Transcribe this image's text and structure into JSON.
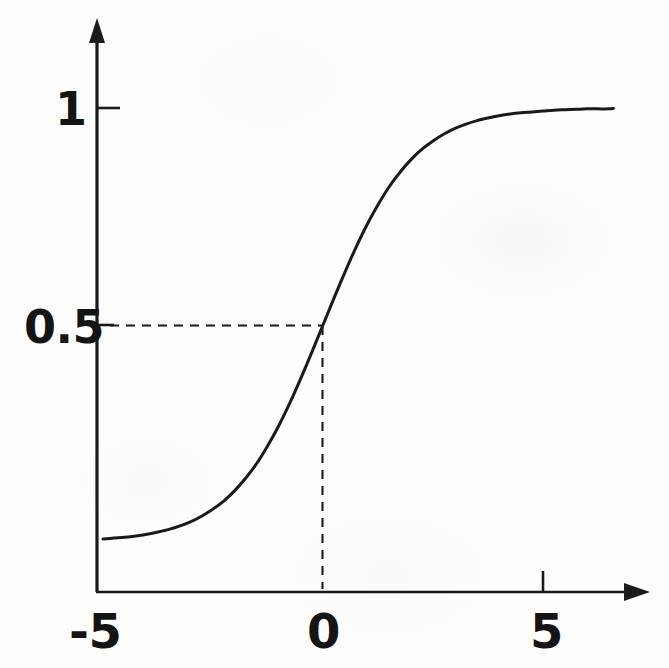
{
  "figure": {
    "kind": "line-plot",
    "background_color": "#fdfdfb",
    "ink_color": "#1a1a1a"
  },
  "labels": {
    "y_tick_one": "1",
    "y_tick_half": "0.5",
    "x_tick_minus_five": "-5",
    "x_tick_zero": "0",
    "x_tick_five": "5"
  },
  "chart_data": {
    "type": "line",
    "title": "",
    "xlabel": "",
    "ylabel": "",
    "xlim": [
      -5,
      6.6
    ],
    "ylim": [
      0,
      1.08
    ],
    "grid": false,
    "legend": null,
    "axis_style": "arrow-tipped open axes",
    "xticks": [
      -5,
      0,
      5
    ],
    "xtick_labels": [
      "-5",
      "0",
      "5"
    ],
    "yticks": [
      0.5,
      1
    ],
    "ytick_labels": [
      "0.5",
      "1"
    ],
    "series": [
      {
        "name": "sigmoid",
        "x": [
          -5.0,
          -4.75,
          -4.5,
          -4.25,
          -4.0,
          -3.75,
          -3.5,
          -3.25,
          -3.0,
          -2.75,
          -2.5,
          -2.25,
          -2.0,
          -1.75,
          -1.5,
          -1.25,
          -1.0,
          -0.75,
          -0.5,
          -0.25,
          0.0,
          0.25,
          0.5,
          0.75,
          1.0,
          1.25,
          1.5,
          1.75,
          2.0,
          2.25,
          2.5,
          2.75,
          3.0,
          3.25,
          3.5,
          3.75,
          4.0,
          4.25,
          4.5,
          4.75,
          5.0,
          5.25,
          5.5,
          5.75,
          6.0,
          6.25,
          6.5,
          6.6
        ],
        "y": [
          0.007,
          0.009,
          0.011,
          0.014,
          0.018,
          0.023,
          0.029,
          0.037,
          0.047,
          0.06,
          0.076,
          0.095,
          0.119,
          0.148,
          0.182,
          0.223,
          0.269,
          0.321,
          0.378,
          0.438,
          0.5,
          0.562,
          0.622,
          0.679,
          0.731,
          0.777,
          0.818,
          0.852,
          0.881,
          0.905,
          0.924,
          0.94,
          0.953,
          0.963,
          0.971,
          0.977,
          0.982,
          0.986,
          0.989,
          0.991,
          0.993,
          0.995,
          0.996,
          0.997,
          0.998,
          0.998,
          0.998,
          0.999
        ]
      }
    ],
    "annotations": [
      {
        "name": "half-value-guide",
        "style": "dashed",
        "from": [
          -5,
          0.5
        ],
        "to": [
          0,
          0.5
        ],
        "orientation": "horizontal"
      },
      {
        "name": "zero-crossing-guide",
        "style": "dashed",
        "from": [
          0,
          0.5
        ],
        "to": [
          0,
          0
        ],
        "orientation": "vertical"
      }
    ]
  }
}
